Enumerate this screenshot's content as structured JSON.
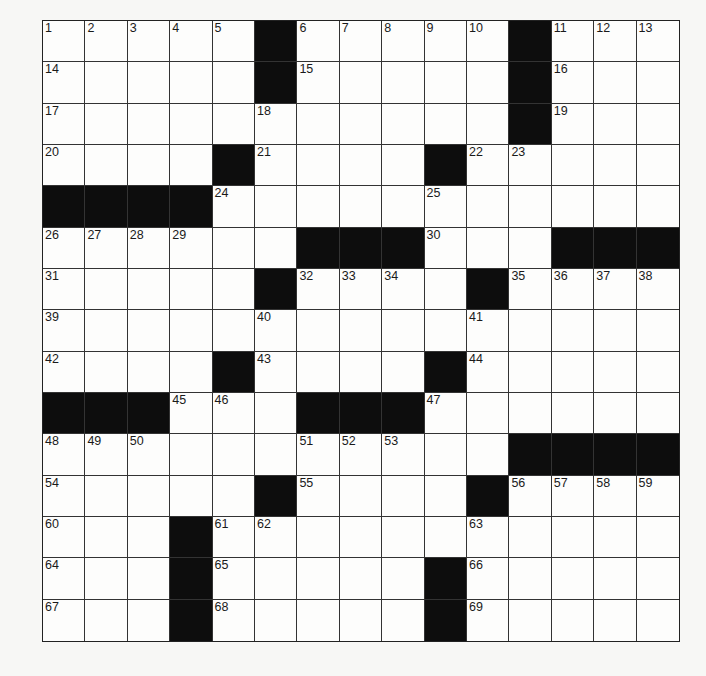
{
  "puzzle": {
    "rows": 15,
    "cols": 15,
    "grid": [
      ".....#.....#...",
      ".....#.....#...",
      "...........#...",
      "....#....#.....",
      "####...........",
      "......###...###",
      ".....#....#....",
      "...............",
      "....#....#.....",
      "###...###......",
      "...........####",
      ".....#....#....",
      "...#...........",
      "...#.....#.....",
      "...#.....#....."
    ],
    "numbers": [
      [
        1,
        2,
        3,
        4,
        5,
        0,
        6,
        7,
        8,
        9,
        10,
        0,
        11,
        12,
        13
      ],
      [
        14,
        0,
        0,
        0,
        0,
        0,
        15,
        0,
        0,
        0,
        0,
        0,
        16,
        0,
        0
      ],
      [
        17,
        0,
        0,
        0,
        0,
        18,
        0,
        0,
        0,
        0,
        0,
        0,
        19,
        0,
        0
      ],
      [
        20,
        0,
        0,
        0,
        0,
        21,
        0,
        0,
        0,
        0,
        22,
        23,
        0,
        0,
        0
      ],
      [
        0,
        0,
        0,
        0,
        24,
        0,
        0,
        0,
        0,
        25,
        0,
        0,
        0,
        0,
        0
      ],
      [
        26,
        27,
        28,
        29,
        0,
        0,
        0,
        0,
        0,
        30,
        0,
        0,
        0,
        0,
        0
      ],
      [
        31,
        0,
        0,
        0,
        0,
        0,
        32,
        33,
        34,
        0,
        0,
        35,
        36,
        37,
        38
      ],
      [
        39,
        0,
        0,
        0,
        0,
        40,
        0,
        0,
        0,
        0,
        41,
        0,
        0,
        0,
        0
      ],
      [
        42,
        0,
        0,
        0,
        0,
        43,
        0,
        0,
        0,
        0,
        44,
        0,
        0,
        0,
        0
      ],
      [
        0,
        0,
        0,
        45,
        46,
        0,
        0,
        0,
        0,
        47,
        0,
        0,
        0,
        0,
        0
      ],
      [
        48,
        49,
        50,
        0,
        0,
        0,
        51,
        52,
        53,
        0,
        0,
        0,
        0,
        0,
        0
      ],
      [
        54,
        0,
        0,
        0,
        0,
        0,
        55,
        0,
        0,
        0,
        0,
        56,
        57,
        58,
        59
      ],
      [
        60,
        0,
        0,
        0,
        61,
        62,
        0,
        0,
        0,
        0,
        63,
        0,
        0,
        0,
        0
      ],
      [
        64,
        0,
        0,
        0,
        65,
        0,
        0,
        0,
        0,
        0,
        66,
        0,
        0,
        0,
        0
      ],
      [
        67,
        0,
        0,
        0,
        68,
        0,
        0,
        0,
        0,
        0,
        69,
        0,
        0,
        0,
        0
      ]
    ],
    "letters": []
  },
  "colors": {
    "black_square": "#0d0d0d",
    "white_square": "#fdfdfc",
    "grid_line": "#333333",
    "background": "#f7f7f5"
  }
}
